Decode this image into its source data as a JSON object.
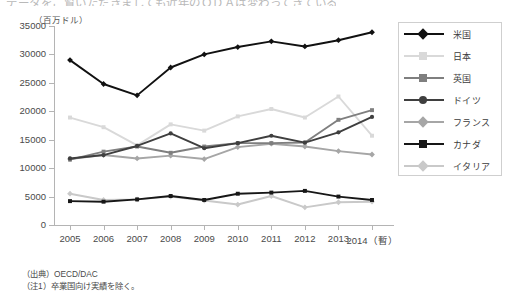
{
  "top_clipped_text": "データをご覧いただきましても近年のＯＤＡは変わってきている。",
  "yaxis_unit": "（百万ドル）",
  "notes": [
    "（出典）OECD/DAC",
    "（注1）卒業国向け実績を除く。"
  ],
  "legend": {
    "position": "right",
    "items": [
      {
        "label": "米国",
        "color": "#111111",
        "marker": "diamond"
      },
      {
        "label": "日本",
        "color": "#d9d9d9",
        "marker": "square"
      },
      {
        "label": "英国",
        "color": "#7f7f7f",
        "marker": "square"
      },
      {
        "label": "ドイツ",
        "color": "#3f3f3f",
        "marker": "circle"
      },
      {
        "label": "フランス",
        "color": "#a6a6a6",
        "marker": "diamond"
      },
      {
        "label": "カナダ",
        "color": "#171717",
        "marker": "square"
      },
      {
        "label": "イタリア",
        "color": "#c9c9c9",
        "marker": "diamond"
      }
    ]
  },
  "chart_data": {
    "type": "line",
    "title": "",
    "xlabel": "",
    "ylabel": "（百万ドル）",
    "x": [
      "2005",
      "2006",
      "2007",
      "2008",
      "2009",
      "2010",
      "2011",
      "2012",
      "2013",
      "2014（暫）"
    ],
    "xtick_labels": [
      "2005",
      "2006",
      "2007",
      "2008",
      "2009",
      "2010",
      "2011",
      "2012",
      "2013",
      "2014（暫）"
    ],
    "ytick_labels": [
      "0",
      "5000",
      "10000",
      "15000",
      "20000",
      "25000",
      "30000",
      "35000"
    ],
    "ylim": [
      0,
      35000
    ],
    "ytick_step": 5000,
    "grid": false,
    "series": [
      {
        "name": "米国",
        "color": "#111111",
        "marker": "diamond",
        "values": [
          29000,
          24800,
          22800,
          27700,
          30000,
          31300,
          32300,
          31400,
          32500,
          33900
        ]
      },
      {
        "name": "日本",
        "color": "#d9d9d9",
        "marker": "square",
        "values": [
          18900,
          17200,
          14000,
          17700,
          16600,
          19100,
          20400,
          18900,
          22600,
          15700
        ]
      },
      {
        "name": "英国",
        "color": "#7f7f7f",
        "marker": "square",
        "values": [
          11500,
          12900,
          13800,
          12700,
          13800,
          14400,
          14400,
          14500,
          18500,
          20200
        ]
      },
      {
        "name": "ドイツ",
        "color": "#3f3f3f",
        "marker": "circle",
        "values": [
          11700,
          12300,
          13900,
          16100,
          13500,
          14400,
          15700,
          14500,
          16300,
          19000
        ]
      },
      {
        "name": "フランス",
        "color": "#a6a6a6",
        "marker": "diamond",
        "values": [
          11600,
          12300,
          11700,
          12200,
          11600,
          13700,
          14300,
          13800,
          13000,
          12400
        ]
      },
      {
        "name": "カナダ",
        "color": "#171717",
        "marker": "square",
        "values": [
          4200,
          4100,
          4500,
          5100,
          4400,
          5500,
          5700,
          6000,
          5000,
          4400
        ]
      },
      {
        "name": "イタリア",
        "color": "#c9c9c9",
        "marker": "diamond",
        "values": [
          5500,
          4400,
          4500,
          5000,
          4300,
          3600,
          5100,
          3100,
          4000,
          4100
        ]
      }
    ]
  }
}
